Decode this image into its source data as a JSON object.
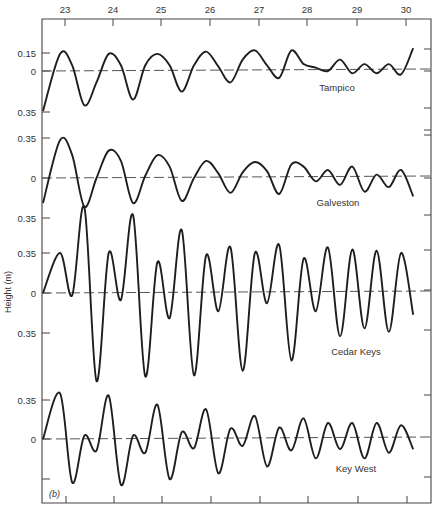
{
  "chart_data": {
    "type": "line",
    "title": "",
    "panel_label": "(b)",
    "xlabel": "",
    "ylabel": "Height (m)",
    "x_axis": {
      "position": "top",
      "ticks": [
        23,
        24,
        25,
        26,
        27,
        28,
        29,
        30
      ],
      "tick_px": [
        65,
        113,
        161,
        210,
        259,
        307,
        357,
        406
      ]
    },
    "grid": false,
    "scale_note": "0.35 m ≈ 40 px vertical",
    "series": [
      {
        "name": "Tampico",
        "label_pos": [
          337,
          91
        ],
        "zero_y": 71,
        "y_ticks": [
          {
            "label": "0.15",
            "y": 53
          },
          {
            "label": "0",
            "y": 71
          },
          {
            "label": "0.35",
            "y": 112
          }
        ],
        "right_ticks": [
          49,
          71,
          108,
          130
        ],
        "x": [
          23.0,
          23.25,
          23.5,
          23.75,
          24.0,
          24.25,
          24.5,
          24.75,
          25.0,
          25.25,
          25.5,
          25.75,
          26.0,
          26.25,
          26.5,
          26.75,
          27.0,
          27.25,
          27.5,
          27.75,
          28.0,
          28.25,
          28.5,
          28.75,
          29.0,
          29.25,
          29.5,
          29.75,
          30.0,
          30.25
        ],
        "values": [
          0.15,
          0.05,
          -0.3,
          -0.1,
          0.15,
          0.05,
          -0.25,
          0.05,
          0.15,
          0.05,
          -0.18,
          0.05,
          0.17,
          0.04,
          -0.1,
          0.1,
          0.18,
          0.05,
          -0.06,
          0.18,
          0.06,
          0.03,
          0.0,
          0.1,
          -0.02,
          0.06,
          -0.02,
          0.06,
          -0.03,
          0.2
        ]
      },
      {
        "name": "Galveston",
        "label_pos": [
          338,
          206
        ],
        "zero_y": 178,
        "y_ticks": [
          {
            "label": "0.35",
            "y": 138
          },
          {
            "label": "0",
            "y": 178
          },
          {
            "label": "0.35",
            "y": 218
          }
        ],
        "right_ticks": [
          135,
          178,
          215
        ],
        "x": [
          23.0,
          23.25,
          23.5,
          23.75,
          24.0,
          24.25,
          24.5,
          24.75,
          25.0,
          25.25,
          25.5,
          25.75,
          26.0,
          26.25,
          26.5,
          26.75,
          27.0,
          27.25,
          27.5,
          27.75,
          28.0,
          28.25,
          28.5,
          28.75,
          29.0,
          29.25,
          29.5,
          29.75,
          30.0,
          30.25
        ],
        "values": [
          0.33,
          0.2,
          -0.25,
          0.0,
          0.24,
          0.15,
          -0.22,
          0.02,
          0.2,
          0.1,
          -0.2,
          0.0,
          0.15,
          0.04,
          -0.13,
          0.05,
          0.14,
          0.06,
          -0.14,
          0.12,
          0.1,
          -0.03,
          0.07,
          -0.06,
          0.1,
          -0.12,
          0.03,
          -0.08,
          0.07,
          -0.16
        ]
      },
      {
        "name": "Cedar Keys",
        "label_pos": [
          356,
          355
        ],
        "zero_y": 293,
        "y_ticks": [
          {
            "label": "0.35",
            "y": 253
          },
          {
            "label": "0",
            "y": 293
          },
          {
            "label": "0.35",
            "y": 333
          }
        ],
        "right_ticks": [
          250,
          290,
          330
        ],
        "x": [
          23.0,
          23.25,
          23.5,
          23.75,
          24.0,
          24.25,
          24.5,
          24.75,
          25.0,
          25.25,
          25.5,
          25.75,
          26.0,
          26.25,
          26.5,
          26.75,
          27.0,
          27.25,
          27.5,
          27.75,
          28.0,
          28.25,
          28.5,
          28.75,
          29.0,
          29.25,
          29.5,
          29.75,
          30.0,
          30.25
        ],
        "values": [
          0.35,
          -0.02,
          0.75,
          -0.77,
          0.35,
          -0.06,
          0.68,
          -0.73,
          0.27,
          -0.22,
          0.55,
          -0.72,
          0.33,
          -0.16,
          0.4,
          -0.68,
          0.35,
          -0.09,
          0.42,
          -0.59,
          0.3,
          -0.16,
          0.4,
          -0.38,
          0.38,
          -0.31,
          0.37,
          -0.34,
          0.35,
          -0.19
        ]
      },
      {
        "name": "Key West",
        "label_pos": [
          356,
          472
        ],
        "zero_y": 439,
        "y_ticks": [
          {
            "label": "0.35",
            "y": 400
          },
          {
            "label": "0",
            "y": 439
          },
          {
            "label": "",
            "y": 479
          }
        ],
        "right_ticks": [
          395,
          477
        ],
        "x": [
          23.0,
          23.25,
          23.5,
          23.75,
          24.0,
          24.25,
          24.5,
          24.75,
          25.0,
          25.25,
          25.5,
          25.75,
          26.0,
          26.25,
          26.5,
          26.75,
          27.0,
          27.25,
          27.5,
          27.75,
          28.0,
          28.25,
          28.5,
          28.75,
          29.0,
          29.25,
          29.5,
          29.75,
          30.0,
          30.25
        ],
        "values": [
          0.4,
          -0.38,
          0.03,
          -0.1,
          0.38,
          -0.4,
          0.03,
          -0.12,
          0.3,
          -0.35,
          0.06,
          -0.08,
          0.26,
          -0.3,
          0.09,
          -0.06,
          0.2,
          -0.24,
          0.1,
          -0.1,
          0.18,
          -0.17,
          0.14,
          -0.09,
          0.14,
          -0.17,
          0.14,
          -0.12,
          0.12,
          -0.09
        ]
      }
    ]
  },
  "figure": {
    "frame": {
      "left": 42,
      "right": 431,
      "top": 19,
      "bottom": 503
    },
    "colors": {
      "ink": "#1e1e1e",
      "axis": "#444444",
      "text": "#333333",
      "background": "#ffffff"
    }
  }
}
